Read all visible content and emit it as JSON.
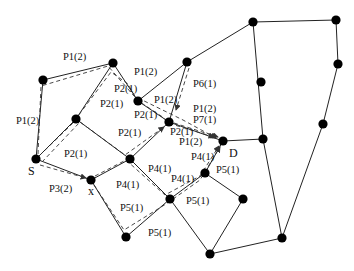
{
  "diagram": {
    "type": "network-multipath-routing",
    "nodes": [
      {
        "id": "n1",
        "x": 43,
        "y": 80
      },
      {
        "id": "n2",
        "x": 113,
        "y": 63
      },
      {
        "id": "n3",
        "x": 138,
        "y": 101
      },
      {
        "id": "n4",
        "x": 187,
        "y": 62
      },
      {
        "id": "n5",
        "x": 253,
        "y": 22
      },
      {
        "id": "n6",
        "x": 336,
        "y": 20
      },
      {
        "id": "n7",
        "x": 76,
        "y": 119
      },
      {
        "id": "n8",
        "x": 169,
        "y": 122
      },
      {
        "id": "n9",
        "x": 261,
        "y": 82
      },
      {
        "id": "n10",
        "x": 338,
        "y": 64
      },
      {
        "id": "S",
        "x": 36,
        "y": 159,
        "label": "S"
      },
      {
        "id": "x",
        "x": 91,
        "y": 180,
        "label": "x"
      },
      {
        "id": "n13",
        "x": 130,
        "y": 159
      },
      {
        "id": "D",
        "x": 223,
        "y": 141,
        "label": "D"
      },
      {
        "id": "n15",
        "x": 263,
        "y": 139
      },
      {
        "id": "n16",
        "x": 323,
        "y": 124
      },
      {
        "id": "n17",
        "x": 205,
        "y": 173
      },
      {
        "id": "n18",
        "x": 170,
        "y": 199
      },
      {
        "id": "n19",
        "x": 243,
        "y": 199
      },
      {
        "id": "n20",
        "x": 126,
        "y": 237
      },
      {
        "id": "n21",
        "x": 282,
        "y": 238
      },
      {
        "id": "n22",
        "x": 210,
        "y": 254
      }
    ],
    "edges": [
      [
        "S",
        "n1"
      ],
      [
        "n1",
        "n2"
      ],
      [
        "n2",
        "n3"
      ],
      [
        "n2",
        "n7"
      ],
      [
        "n3",
        "n8"
      ],
      [
        "n3",
        "n4"
      ],
      [
        "n4",
        "n5"
      ],
      [
        "n4",
        "n8"
      ],
      [
        "n5",
        "n6"
      ],
      [
        "n5",
        "n15"
      ],
      [
        "n6",
        "n10"
      ],
      [
        "n10",
        "n16"
      ],
      [
        "n16",
        "n21"
      ],
      [
        "S",
        "n7"
      ],
      [
        "n7",
        "n13"
      ],
      [
        "S",
        "x"
      ],
      [
        "x",
        "n13"
      ],
      [
        "n13",
        "n8"
      ],
      [
        "n8",
        "D"
      ],
      [
        "D",
        "n15"
      ],
      [
        "n15",
        "n21"
      ],
      [
        "n13",
        "n18"
      ],
      [
        "x",
        "n20"
      ],
      [
        "n20",
        "n18"
      ],
      [
        "n18",
        "n17"
      ],
      [
        "n17",
        "D"
      ],
      [
        "n17",
        "n19"
      ],
      [
        "n19",
        "n22"
      ],
      [
        "n18",
        "n22"
      ],
      [
        "n22",
        "n21"
      ]
    ],
    "paths": [
      {
        "name": "P1(2)",
        "points": [
          [
            38,
            154
          ],
          [
            41,
            86
          ],
          [
            108,
            66
          ],
          [
            134,
            96
          ],
          [
            183,
            120
          ],
          [
            216,
            138
          ]
        ]
      },
      {
        "name": "P2(1)",
        "points": [
          [
            40,
            155
          ],
          [
            72,
            124
          ],
          [
            111,
            72
          ],
          [
            128,
            84
          ],
          [
            137,
            100
          ],
          [
            164,
            118
          ],
          [
            168,
            123
          ],
          [
            214,
            137
          ]
        ]
      },
      {
        "name": "P2(1)-b",
        "points": [
          [
            42,
            162
          ],
          [
            80,
            122
          ],
          [
            125,
            155
          ],
          [
            164,
            127
          ]
        ]
      },
      {
        "name": "P3(2)",
        "points": [
          [
            40,
            165
          ],
          [
            86,
            178
          ]
        ]
      },
      {
        "name": "P4(1)",
        "points": [
          [
            95,
            176
          ],
          [
            126,
            160
          ],
          [
            165,
            195
          ],
          [
            200,
            176
          ],
          [
            219,
            146
          ]
        ]
      },
      {
        "name": "P5(1)",
        "points": [
          [
            94,
            185
          ],
          [
            124,
            230
          ],
          [
            166,
            204
          ],
          [
            200,
            180
          ],
          [
            220,
            147
          ]
        ]
      },
      {
        "name": "P6(1)",
        "points": [
          [
            189,
            68
          ],
          [
            176,
            110
          ]
        ]
      },
      {
        "name": "P7(1)",
        "points": [
          [
            174,
            123
          ],
          [
            218,
            137
          ]
        ]
      }
    ],
    "labels": [
      {
        "text": "P1(2)",
        "x": 63,
        "y": 60
      },
      {
        "text": "P1(2)",
        "x": 134,
        "y": 75
      },
      {
        "text": "P2(1)",
        "x": 114,
        "y": 92
      },
      {
        "text": "P2(1)",
        "x": 100,
        "y": 107
      },
      {
        "text": "P1(2)",
        "x": 16,
        "y": 124
      },
      {
        "text": "P1(2)",
        "x": 154,
        "y": 103
      },
      {
        "text": "P2(1)",
        "x": 134,
        "y": 118
      },
      {
        "text": "P2(1)",
        "x": 118,
        "y": 136
      },
      {
        "text": "P6(1)",
        "x": 193,
        "y": 87
      },
      {
        "text": "P1(2)",
        "x": 193,
        "y": 112
      },
      {
        "text": "P7(1)",
        "x": 193,
        "y": 123
      },
      {
        "text": "P2(1)",
        "x": 170,
        "y": 135
      },
      {
        "text": "P1(2)",
        "x": 179,
        "y": 145
      },
      {
        "text": "P2(1)",
        "x": 64,
        "y": 157
      },
      {
        "text": "P3(2)",
        "x": 49,
        "y": 192
      },
      {
        "text": "P4(1)",
        "x": 148,
        "y": 172
      },
      {
        "text": "P4(1)",
        "x": 191,
        "y": 160
      },
      {
        "text": "P4(1)",
        "x": 116,
        "y": 188
      },
      {
        "text": "P4(1)",
        "x": 171,
        "y": 182
      },
      {
        "text": "P5(1)",
        "x": 216,
        "y": 173
      },
      {
        "text": "P5(1)",
        "x": 120,
        "y": 211
      },
      {
        "text": "P5(1)",
        "x": 186,
        "y": 204
      },
      {
        "text": "P5(1)",
        "x": 148,
        "y": 236
      }
    ],
    "node_labels": [
      {
        "text": "S",
        "x": 28,
        "y": 175
      },
      {
        "text": "x",
        "x": 88,
        "y": 195
      },
      {
        "text": "D",
        "x": 229,
        "y": 157
      }
    ]
  }
}
